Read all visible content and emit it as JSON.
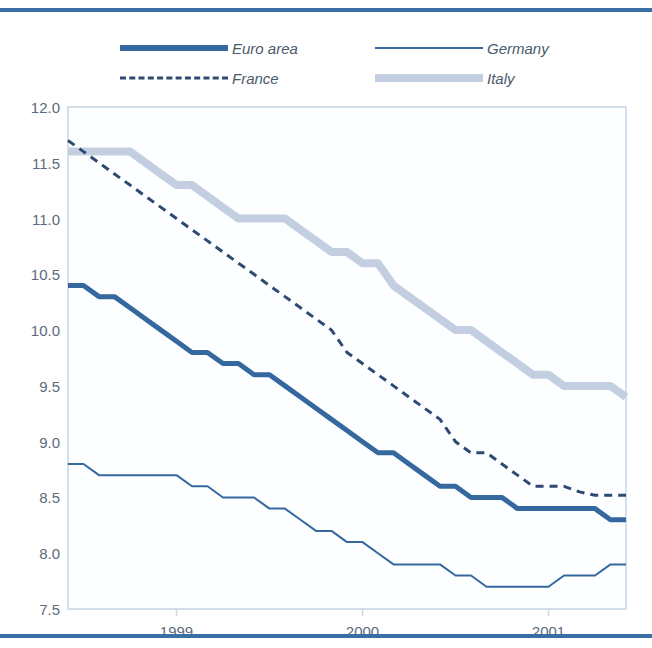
{
  "figure": {
    "width": 652,
    "height": 648,
    "background": "#ffffff",
    "top_rule_color": "#3a6ea5",
    "bottom_rule_color": "#3a6ea5"
  },
  "legend": {
    "entries": [
      {
        "label": "Euro area",
        "style": "thick-solid",
        "color": "#35689f",
        "swatch": "swatch-euro-area"
      },
      {
        "label": "Germany",
        "style": "thin-solid",
        "color": "#35689f",
        "swatch": "swatch-germany"
      },
      {
        "label": "France",
        "style": "dashed",
        "color": "#2e4a72",
        "swatch": "swatch-france"
      },
      {
        "label": "Italy",
        "style": "thick-solid",
        "color": "#c3cfe0",
        "swatch": "swatch-italy"
      }
    ]
  },
  "axes": {
    "y_ticks": [
      "12.0",
      "11.5",
      "11.0",
      "10.5",
      "10.0",
      "9.5",
      "9.0",
      "8.5",
      "8.0",
      "7.5"
    ],
    "y_tick_values": [
      12.0,
      11.5,
      11.0,
      10.5,
      10.0,
      9.5,
      9.0,
      8.5,
      8.0,
      7.5
    ],
    "x_ticks": [
      "1999",
      "2000",
      "2001"
    ],
    "x_tick_values": [
      12,
      24,
      36
    ],
    "grid": true,
    "grid_color": "#b9c9dd",
    "frame_color": "#c9d6e4"
  },
  "chart_data": {
    "type": "line",
    "title": "",
    "subtitle": "",
    "xlabel": "",
    "ylabel": "",
    "xlim": [
      5,
      41
    ],
    "ylim": [
      7.5,
      12.0
    ],
    "x_tick_labels": [
      "1999",
      "2000",
      "2001"
    ],
    "y_tick_labels": [
      "7.5",
      "8.0",
      "8.5",
      "9.0",
      "9.5",
      "10.0",
      "10.5",
      "11.0",
      "11.5",
      "12.0"
    ],
    "legend_position": "top",
    "x_units": "month index from start of 1998",
    "x": [
      5,
      6,
      7,
      8,
      9,
      10,
      11,
      12,
      13,
      14,
      15,
      16,
      17,
      18,
      19,
      20,
      21,
      22,
      23,
      24,
      25,
      26,
      27,
      28,
      29,
      30,
      31,
      32,
      33,
      34,
      35,
      36,
      37,
      38,
      39,
      40,
      41
    ],
    "series": [
      {
        "name": "Euro area",
        "color": "#35689f",
        "style": "thick-solid",
        "width": 5,
        "values": [
          10.4,
          10.4,
          10.3,
          10.3,
          10.2,
          10.1,
          10.0,
          9.9,
          9.8,
          9.8,
          9.7,
          9.7,
          9.6,
          9.6,
          9.5,
          9.4,
          9.3,
          9.2,
          9.1,
          9.0,
          8.9,
          8.9,
          8.8,
          8.7,
          8.6,
          8.6,
          8.5,
          8.5,
          8.5,
          8.4,
          8.4,
          8.4,
          8.4,
          8.4,
          8.4,
          8.3,
          8.3
        ]
      },
      {
        "name": "Germany",
        "color": "#35689f",
        "style": "thin-solid",
        "width": 2,
        "values": [
          8.8,
          8.8,
          8.7,
          8.7,
          8.7,
          8.7,
          8.7,
          8.7,
          8.6,
          8.6,
          8.5,
          8.5,
          8.5,
          8.4,
          8.4,
          8.3,
          8.2,
          8.2,
          8.1,
          8.1,
          8.0,
          7.9,
          7.9,
          7.9,
          7.9,
          7.8,
          7.8,
          7.7,
          7.7,
          7.7,
          7.7,
          7.7,
          7.8,
          7.8,
          7.8,
          7.9,
          7.9
        ]
      },
      {
        "name": "France",
        "color": "#2e4a72",
        "style": "dashed",
        "width": 3,
        "values": [
          11.7,
          11.6,
          11.5,
          11.4,
          11.3,
          11.2,
          11.1,
          11.0,
          10.9,
          10.8,
          10.7,
          10.6,
          10.5,
          10.4,
          10.3,
          10.2,
          10.1,
          10.0,
          9.8,
          9.7,
          9.6,
          9.5,
          9.4,
          9.3,
          9.2,
          9.0,
          8.9,
          8.9,
          8.8,
          8.7,
          8.6,
          8.6,
          8.6,
          8.55,
          8.52,
          8.52,
          8.52
        ]
      },
      {
        "name": "Italy",
        "color": "#c3cfe0",
        "style": "thick-solid",
        "width": 8,
        "values": [
          11.6,
          11.6,
          11.6,
          11.6,
          11.6,
          11.5,
          11.4,
          11.3,
          11.3,
          11.2,
          11.1,
          11.0,
          11.0,
          11.0,
          11.0,
          10.9,
          10.8,
          10.7,
          10.7,
          10.6,
          10.6,
          10.4,
          10.3,
          10.2,
          10.1,
          10.0,
          10.0,
          9.9,
          9.8,
          9.7,
          9.6,
          9.6,
          9.5,
          9.5,
          9.5,
          9.5,
          9.4
        ]
      }
    ]
  }
}
